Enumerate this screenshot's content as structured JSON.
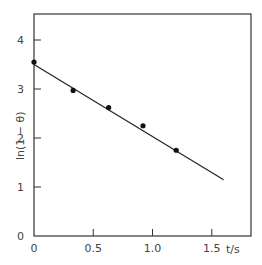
{
  "chart_data": {
    "type": "scatter",
    "title": "",
    "xlabel": "t/s",
    "ylabel": "ln(1 - θ)",
    "xlim": [
      0,
      1.75
    ],
    "ylim": [
      0,
      4.5
    ],
    "grid": false,
    "legend": null,
    "x_ticks": [
      "0",
      "0.5",
      "1.0",
      "1.5"
    ],
    "y_ticks": [
      "0",
      "1",
      "2",
      "3",
      "4"
    ],
    "series": [
      {
        "name": "measured",
        "style": "filled-circle markers",
        "x": [
          0.0,
          0.33,
          0.63,
          0.92,
          1.2
        ],
        "y": [
          3.55,
          2.97,
          2.62,
          2.25,
          1.75
        ]
      },
      {
        "name": "linear fit",
        "style": "solid line",
        "x": [
          0.0,
          1.6
        ],
        "y": [
          3.5,
          1.15
        ]
      }
    ]
  },
  "axes": {
    "x_label": "t/s",
    "y_label": "ln(1 − θ)",
    "x_tick_labels": [
      "0",
      "0.5",
      "1.0",
      "1.5"
    ],
    "y_tick_labels": [
      "0",
      "1",
      "2",
      "3",
      "4"
    ]
  }
}
